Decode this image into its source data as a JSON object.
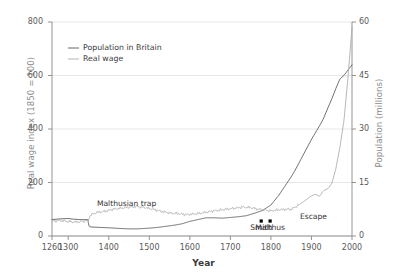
{
  "chart_data": {
    "type": "line",
    "title": "",
    "xlabel": "Year",
    "ylabel_left": "Real wage index (1850 = 100)",
    "ylabel_right": "Population (millions)",
    "xlim": [
      1260,
      2000
    ],
    "ylim_left": [
      0,
      800
    ],
    "ylim_right": [
      0,
      60
    ],
    "xticks": [
      1260,
      1300,
      1400,
      1500,
      1600,
      1700,
      1800,
      1900,
      2000
    ],
    "xtick_labels": [
      "1260",
      "1300",
      "1400",
      "1500",
      "1600",
      "1700",
      "1800",
      "1900",
      "2000"
    ],
    "yticks_left": [
      0,
      200,
      400,
      600,
      800
    ],
    "ytick_labels_left": [
      "0",
      "200",
      "400",
      "600",
      "800"
    ],
    "yticks_right": [
      0,
      15,
      30,
      45,
      60
    ],
    "ytick_labels_right": [
      "0",
      "15",
      "30",
      "45",
      "60"
    ],
    "grid": "horizontal",
    "legend_position": "top-left-inside",
    "colors": {
      "population": "#555555",
      "real_wage": "#aaaaaa",
      "grid": "#dcdcdc",
      "axis": "#888888",
      "marker": "#000000"
    },
    "series": [
      {
        "name": "Population in Britain",
        "axis": "right",
        "units": "millions",
        "color": "#555555",
        "x": [
          1260,
          1280,
          1300,
          1315,
          1330,
          1348,
          1352,
          1360,
          1380,
          1400,
          1430,
          1450,
          1470,
          1500,
          1520,
          1540,
          1560,
          1580,
          1600,
          1620,
          1640,
          1660,
          1680,
          1700,
          1720,
          1740,
          1760,
          1780,
          1800,
          1820,
          1840,
          1850,
          1860,
          1880,
          1900,
          1910,
          1920,
          1930,
          1940,
          1950,
          1960,
          1970,
          1980,
          1990,
          2000
        ],
        "values": [
          4.6,
          4.8,
          4.9,
          4.7,
          4.6,
          4.6,
          2.6,
          2.5,
          2.4,
          2.3,
          2.1,
          2.0,
          2.0,
          2.2,
          2.4,
          2.7,
          3.0,
          3.4,
          4.1,
          4.6,
          5.1,
          5.1,
          5.0,
          5.2,
          5.4,
          5.7,
          6.4,
          7.2,
          8.7,
          11.5,
          14.9,
          16.6,
          18.5,
          22.8,
          27.1,
          29.0,
          30.9,
          33.0,
          35.8,
          38.4,
          41.3,
          44.0,
          45.0,
          46.5,
          48.0
        ],
        "values_scaled_note": "Right axis, population of Britain in millions; rises sharply after 1800 to about 59 by 2000"
      },
      {
        "name": "Real wage",
        "axis": "left",
        "units": "index, 1850 = 100",
        "color": "#aaaaaa",
        "x": [
          1260,
          1280,
          1300,
          1320,
          1340,
          1348,
          1355,
          1370,
          1390,
          1410,
          1430,
          1450,
          1470,
          1490,
          1510,
          1530,
          1550,
          1570,
          1590,
          1610,
          1630,
          1650,
          1670,
          1690,
          1710,
          1730,
          1750,
          1770,
          1790,
          1800,
          1820,
          1840,
          1850,
          1860,
          1880,
          1900,
          1910,
          1920,
          1930,
          1940,
          1950,
          1960,
          1970,
          1980,
          1990,
          2000
        ],
        "values": [
          55,
          58,
          54,
          52,
          56,
          57,
          78,
          88,
          92,
          100,
          104,
          108,
          110,
          106,
          100,
          92,
          86,
          84,
          80,
          82,
          86,
          92,
          96,
          100,
          104,
          108,
          106,
          100,
          96,
          94,
          98,
          100,
          100,
          108,
          128,
          150,
          156,
          148,
          170,
          176,
          196,
          250,
          330,
          430,
          590,
          780
        ]
      }
    ],
    "annotations": [
      {
        "text": "Malthusian trap",
        "x": 1425,
        "y_left": 120
      },
      {
        "text": "Smith",
        "x": 1776,
        "y_left": 30
      },
      {
        "text": "Malthus",
        "x": 1798,
        "y_left": 30
      },
      {
        "text": "Escape",
        "x": 1905,
        "y_left": 70
      }
    ],
    "point_markers": [
      {
        "label": "Smith",
        "x": 1776,
        "y_left": 56
      },
      {
        "label": "Malthus",
        "x": 1798,
        "y_left": 56
      }
    ]
  },
  "legend": {
    "items": [
      {
        "label": "Population in Britain",
        "color": "#555555"
      },
      {
        "label": "Real wage",
        "color": "#aaaaaa"
      }
    ]
  }
}
